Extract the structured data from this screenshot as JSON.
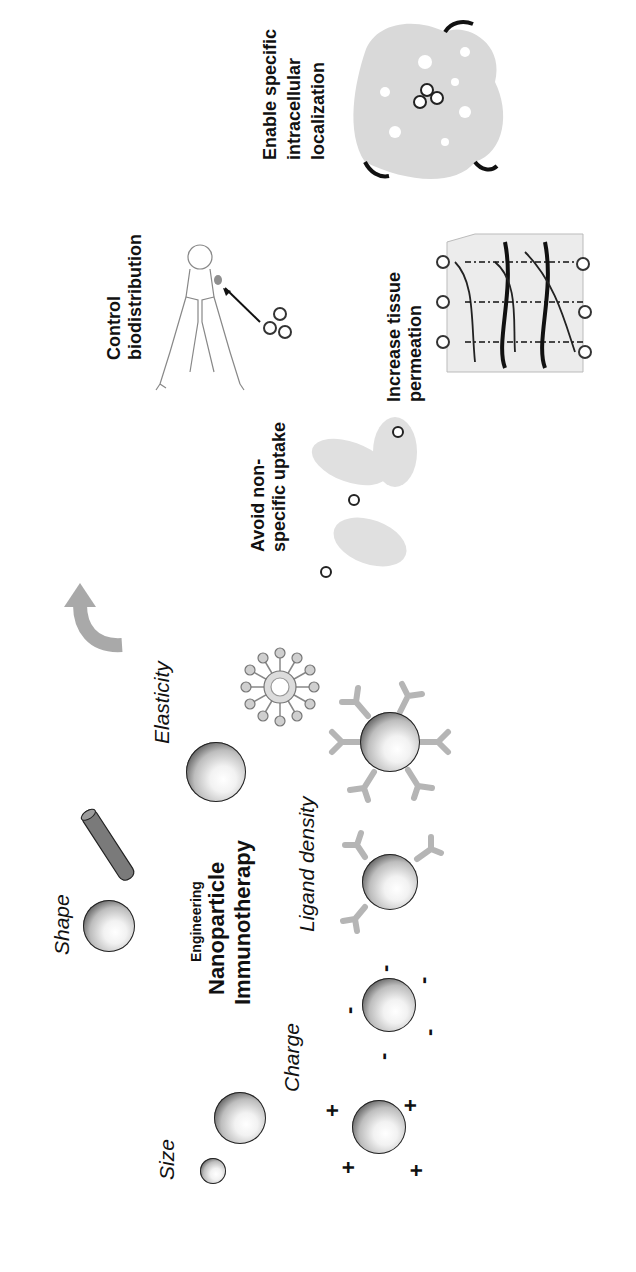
{
  "title": {
    "line1": "Engineering",
    "line2": "Nanoparticle",
    "line3": "Immunotherapy"
  },
  "properties": {
    "size": "Size",
    "shape": "Shape",
    "elasticity": "Elasticity",
    "charge": "Charge",
    "ligand_density": "Ligand density"
  },
  "charge_symbols": {
    "positive": "+",
    "negative": "-"
  },
  "outcomes": {
    "avoid_uptake": "Avoid non-\nspecific uptake",
    "biodistribution": "Control\nbiodistribution",
    "tissue_permeation": "Increase tissue\npermeation",
    "intracellular": "Enable specific\nintracellular\nlocalization"
  },
  "colors": {
    "rod": "#7a7a7a",
    "ligand": "#b5b5b5",
    "arrow": "#a9a9a9",
    "cell": "#d9d9d9",
    "organ": "#8f8f8f"
  },
  "orientation": "rotated-90-ccw"
}
